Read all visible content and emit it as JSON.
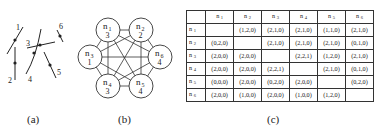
{
  "panels": {
    "a": {
      "caption": "(a)",
      "segments": [
        {
          "label": "1",
          "x1": 7,
          "y1": 54,
          "x2": 23,
          "y2": 27,
          "dot": [
            15,
            40
          ],
          "label_pos": [
            16,
            30
          ]
        },
        {
          "label": "2",
          "x1": 15,
          "y1": 47,
          "x2": 15,
          "y2": 80,
          "dot": [
            15,
            63
          ],
          "label_pos": [
            8,
            83
          ]
        },
        {
          "label": "3",
          "x1": 27,
          "y1": 48,
          "x2": 55,
          "y2": 42,
          "dot": [
            40,
            45
          ],
          "label_pos": [
            26,
            46
          ]
        },
        {
          "label": "4",
          "x1": 41,
          "y1": 29,
          "x2": 26,
          "y2": 74,
          "dot": [
            34,
            53
          ],
          "label_pos": [
            28,
            82
          ],
          "curved": true
        },
        {
          "label": "5",
          "x1": 44,
          "y1": 52,
          "x2": 56,
          "y2": 78,
          "dot": [
            50,
            65
          ],
          "label_pos": [
            57,
            75
          ]
        },
        {
          "label": "6",
          "x1": 57,
          "y1": 30,
          "x2": 63,
          "y2": 42,
          "dot": [
            60,
            36
          ],
          "label_pos": [
            59,
            29
          ]
        }
      ]
    },
    "b": {
      "caption": "(b)",
      "nodes": [
        {
          "id": "n1",
          "name": "n",
          "sub": "1",
          "value": "3",
          "cx": 108,
          "cy": 30
        },
        {
          "id": "n2",
          "name": "n",
          "sub": "2",
          "value": "2",
          "cx": 141,
          "cy": 30
        },
        {
          "id": "n3",
          "name": "n",
          "sub": "3",
          "value": "1",
          "cx": 90,
          "cy": 57
        },
        {
          "id": "n6",
          "name": "n",
          "sub": "6",
          "value": "4",
          "cx": 160,
          "cy": 57
        },
        {
          "id": "n4",
          "name": "n",
          "sub": "4",
          "value": "3",
          "cx": 108,
          "cy": 86
        },
        {
          "id": "n5",
          "name": "n",
          "sub": "5",
          "value": "4",
          "cx": 141,
          "cy": 86
        }
      ],
      "node_radius": 12,
      "edges": [
        [
          "n1",
          "n2"
        ],
        [
          "n1",
          "n3"
        ],
        [
          "n1",
          "n4"
        ],
        [
          "n1",
          "n5"
        ],
        [
          "n1",
          "n6"
        ],
        [
          "n2",
          "n3"
        ],
        [
          "n2",
          "n4"
        ],
        [
          "n2",
          "n5"
        ],
        [
          "n2",
          "n6"
        ],
        [
          "n3",
          "n4"
        ],
        [
          "n3",
          "n5"
        ],
        [
          "n3",
          "n6"
        ],
        [
          "n4",
          "n5"
        ],
        [
          "n4",
          "n6"
        ],
        [
          "n5",
          "n6"
        ]
      ]
    },
    "c": {
      "caption": "(c)",
      "columns": [
        "n1",
        "n2",
        "n3",
        "n4",
        "n5",
        "n6"
      ],
      "col_labels": [
        {
          "n": "n",
          "sub": "1"
        },
        {
          "n": "n",
          "sub": "2"
        },
        {
          "n": "n",
          "sub": "3"
        },
        {
          "n": "n",
          "sub": "4"
        },
        {
          "n": "n",
          "sub": "5"
        },
        {
          "n": "n",
          "sub": "6"
        }
      ],
      "rows": [
        {
          "label": {
            "n": "n",
            "sub": "1"
          },
          "cells": [
            "",
            "(1,2,0)",
            "(2,1,0)",
            "(2,1,0)",
            "(1,1,0)",
            "(2,1,0)"
          ]
        },
        {
          "label": {
            "n": "n",
            "sub": "2"
          },
          "cells": [
            "(0,2,0)",
            "",
            "(2,1,0)",
            "(2,1,0)",
            "(2,1,0)",
            "(0,1,0)"
          ]
        },
        {
          "label": {
            "n": "n",
            "sub": "3"
          },
          "cells": [
            "(2,0,0)",
            "(2,0,0)",
            "",
            "(2,2,1)",
            "(1,2,0)",
            "(2,1,0)"
          ]
        },
        {
          "label": {
            "n": "n",
            "sub": "4"
          },
          "cells": [
            "(2,0,0)",
            "(2,0,0)",
            "(2,2,1)",
            "",
            "(2,1,0)",
            "(0,1,0)"
          ]
        },
        {
          "label": {
            "n": "n",
            "sub": "5"
          },
          "cells": [
            "(0,0,0)",
            "(2,0,0)",
            "(0,2,0)",
            "(2,0,0)",
            "",
            "(0,2,0)"
          ]
        },
        {
          "label": {
            "n": "n",
            "sub": "6"
          },
          "cells": [
            "(2,0,0)",
            "(1,0,0)",
            "(2,0,0)",
            "(1,0,0)",
            "(1,2,0)",
            ""
          ]
        }
      ]
    }
  }
}
